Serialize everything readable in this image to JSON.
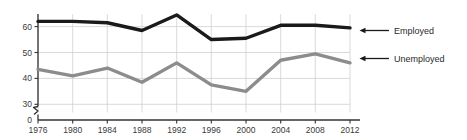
{
  "chart_data": {
    "type": "line",
    "title": "",
    "xlabel": "",
    "ylabel": "",
    "categories": [
      1976,
      1980,
      1984,
      1988,
      1992,
      1996,
      2000,
      2004,
      2008,
      2012
    ],
    "xtick_labels": [
      "1976",
      "1980",
      "1984",
      "1988",
      "1992",
      "1996",
      "2000",
      "2004",
      "2008",
      "2012"
    ],
    "ytick_labels": [
      "0",
      "30",
      "40",
      "50",
      "60"
    ],
    "ytick_values": [
      0,
      30,
      40,
      50,
      60
    ],
    "ylim": [
      30,
      66
    ],
    "xlim": [
      1976,
      2012
    ],
    "grid": true,
    "axis_break": true,
    "axis_break_symbol": "zigzag",
    "legend_position": "right-outside",
    "series": [
      {
        "name": "Employed",
        "color": "#1a1a1a",
        "values": [
          62.0,
          62.0,
          61.5,
          58.5,
          64.5,
          55.0,
          55.5,
          60.5,
          60.5,
          59.5
        ]
      },
      {
        "name": "Unemployed",
        "color": "#8c8c8c",
        "values": [
          43.5,
          41.0,
          44.0,
          38.5,
          46.0,
          37.5,
          35.0,
          47.0,
          49.5,
          46.0
        ]
      }
    ]
  },
  "legend": {
    "items": [
      {
        "label": "Employed",
        "color": "#1a1a1a"
      },
      {
        "label": "Unemployed",
        "color": "#8c8c8c"
      }
    ]
  },
  "colors": {
    "employed": "#1a1a1a",
    "unemployed": "#8c8c8c",
    "grid": "#cfcfcf",
    "axis": "#333333",
    "text": "#3a3a3a",
    "background": "#ffffff"
  }
}
